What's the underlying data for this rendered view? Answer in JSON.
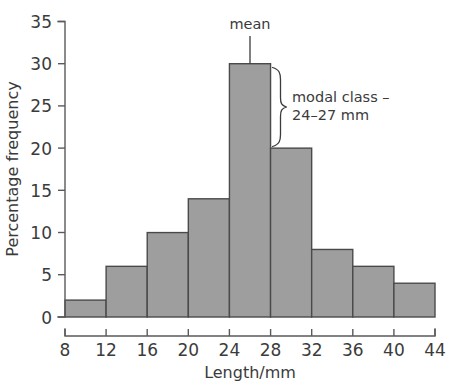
{
  "chart_data": {
    "type": "bar",
    "title": "",
    "subtitle": "",
    "xlabel": "Length/mm",
    "ylabel": "Percentage frequency",
    "categories": [
      "8–12",
      "12–16",
      "16–20",
      "20–24",
      "24–28",
      "28–32",
      "32–36",
      "36–40",
      "40–44"
    ],
    "bin_edges": [
      8,
      12,
      16,
      20,
      24,
      28,
      32,
      36,
      40,
      44
    ],
    "values": [
      2,
      6,
      10,
      14,
      30,
      20,
      8,
      6,
      4
    ],
    "xlim": [
      8,
      44
    ],
    "ylim": [
      0,
      35
    ],
    "xticks": [
      8,
      12,
      16,
      20,
      24,
      28,
      32,
      36,
      40,
      44
    ],
    "yticks": [
      0,
      5,
      10,
      15,
      20,
      25,
      30,
      35
    ],
    "xtick_labels": [
      "8",
      "12",
      "16",
      "20",
      "24",
      "28",
      "32",
      "36",
      "40",
      "44"
    ],
    "ytick_labels": [
      "0",
      "5",
      "10",
      "15",
      "20",
      "25",
      "30",
      "35"
    ],
    "grid": false,
    "legend": false,
    "legend_position": "none",
    "bar_fill_color": "#9e9e9e",
    "bar_stroke_color": "#4a4a4a",
    "axis_color": "#5a5a5a",
    "text_color": "#3b3b3b",
    "background_color": "#ffffff",
    "annotations": [
      {
        "name": "mean",
        "label": "mean",
        "kind": "leader-line",
        "x_value": 26,
        "y_from": 33.6,
        "y_to": 30
      },
      {
        "name": "modal-class",
        "label_line1": "modal class –",
        "label_line2": "24–27 mm",
        "kind": "brace",
        "x_value": 28,
        "y_top": 30,
        "y_bottom": 20
      }
    ]
  }
}
